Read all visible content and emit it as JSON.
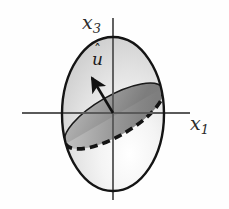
{
  "figure": {
    "type": "diagram",
    "background_color": "#fefefe",
    "canvas": {
      "width": 229,
      "height": 209
    },
    "axes": {
      "origin": {
        "x": 113,
        "y": 113
      },
      "color": "#555555",
      "vertical": {
        "name": "x3-axis",
        "label_base": "x",
        "label_sub": "3",
        "x": 113,
        "y_top": 18,
        "y_bottom": 200
      },
      "horizontal": {
        "name": "x1-axis",
        "label_base": "x",
        "label_sub": "1",
        "y": 113,
        "x_left": 22,
        "x_right": 190
      }
    },
    "sphere": {
      "name": "sphere-outline",
      "center": {
        "x": 113,
        "y": 114
      },
      "rx": 51,
      "ry": 77,
      "stroke_color": "#141414",
      "stroke_width": 2.4,
      "fill_light": "#fdfdfd",
      "fill_mid": "#d8d8d8",
      "fill_dark": "#c2c2c2"
    },
    "disk": {
      "name": "tilted-disk",
      "center": {
        "x": 114,
        "y": 116
      },
      "rx": 56,
      "ry": 20,
      "rotation_deg": -30,
      "fill_light": "#cbcbcb",
      "fill_mid": "#a5a5a5",
      "fill_dark": "#8a8a8a",
      "back_edge_stroke": "#1a1a1a",
      "back_edge_width": 1.6,
      "front_edge_stroke": "#141414",
      "front_edge_width": 3.6,
      "front_edge_dash": "8 5"
    },
    "vector": {
      "name": "unit-normal-vector",
      "label_base": "u",
      "label_hat": "ˆ",
      "from": {
        "x": 113,
        "y": 113
      },
      "to": {
        "x": 90,
        "y": 74
      },
      "stroke_color": "#111111",
      "stroke_width": 2.6,
      "arrowhead_color": "#111111"
    }
  }
}
